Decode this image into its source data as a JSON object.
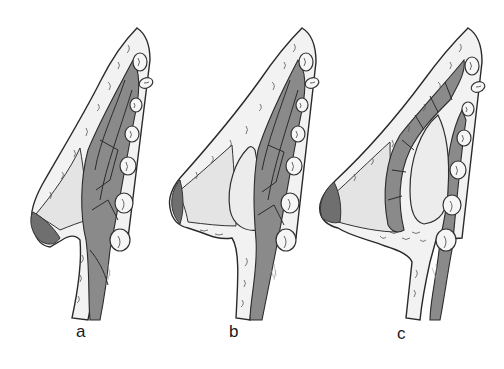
{
  "figure": {
    "colors": {
      "background": "#ffffff",
      "muscle": "#8a8a8a",
      "skin_fat": "#f2f2f2",
      "gland_implant": "#e8e8e8",
      "nipple": "#6f6f6f",
      "outline": "#2a2a2a"
    },
    "panels": [
      {
        "id": "a",
        "label": "a",
        "content": "natural breast: skin/fat layer, glandular tissue, pectoralis muscle, ribs"
      },
      {
        "id": "b",
        "label": "b",
        "content": "breast with implant placed beneath gland, above pectoralis muscle"
      },
      {
        "id": "c",
        "label": "c",
        "content": "breast with implant placed beneath pectoralis muscle"
      }
    ]
  }
}
